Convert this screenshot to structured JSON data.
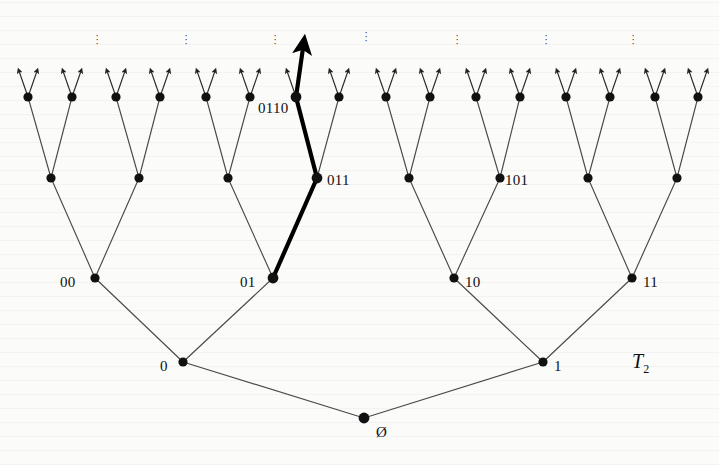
{
  "figure": {
    "tree_name": "T",
    "tree_subscript": "2",
    "background": "#fbfbfa",
    "node_color": "#111111",
    "edge_color": "#4a4a4a",
    "highlight_color": "#000000"
  },
  "labels": [
    {
      "name": "root-label",
      "text": "Ø",
      "x": 376,
      "y": 424
    },
    {
      "name": "node-0-label",
      "text": "0",
      "x": 160,
      "y": 358
    },
    {
      "name": "node-1-label",
      "text": "1",
      "x": 554,
      "y": 358
    },
    {
      "name": "node-00-label",
      "text": "00",
      "x": 60,
      "y": 274
    },
    {
      "name": "node-01-label",
      "text": "01",
      "x": 240,
      "y": 274
    },
    {
      "name": "node-10-label",
      "text": "10",
      "x": 465,
      "y": 274
    },
    {
      "name": "node-11-label",
      "text": "11",
      "x": 643,
      "y": 274
    },
    {
      "name": "node-011-label",
      "text": "011",
      "x": 327,
      "y": 172
    },
    {
      "name": "node-101-label",
      "text": "101",
      "x": 505,
      "y": 172
    },
    {
      "name": "node-0110-label",
      "text": "0110",
      "x": 258,
      "y": 100
    }
  ],
  "ellipses": [
    {
      "name": "ellipsis-1",
      "x": 93,
      "y": 33
    },
    {
      "name": "ellipsis-2",
      "x": 182,
      "y": 33
    },
    {
      "name": "ellipsis-3",
      "x": 271,
      "y": 33
    },
    {
      "name": "ellipsis-4",
      "x": 362,
      "y": 30
    },
    {
      "name": "ellipsis-5",
      "x": 453,
      "y": 33
    },
    {
      "name": "ellipsis-6",
      "x": 542,
      "y": 33
    },
    {
      "name": "ellipsis-7",
      "x": 629,
      "y": 33
    }
  ],
  "chart_data": {
    "type": "diagram",
    "levels": [
      {
        "depth": 0,
        "y": 418,
        "count": 1,
        "x": [
          364
        ]
      },
      {
        "depth": 1,
        "y": 362,
        "count": 2,
        "x": [
          183,
          543
        ]
      },
      {
        "depth": 2,
        "y": 278,
        "count": 4,
        "x": [
          95,
          273,
          454,
          632
        ]
      },
      {
        "depth": 3,
        "y": 178,
        "count": 8,
        "x": [
          51,
          139,
          228,
          317,
          409,
          500,
          588,
          677
        ]
      },
      {
        "depth": 4,
        "y": 97,
        "count": 16,
        "x": [
          28,
          72,
          116,
          160,
          206,
          250,
          296,
          339,
          386,
          430,
          476,
          520,
          566,
          610,
          655,
          698
        ]
      }
    ],
    "highlighted_path": [
      "Ø",
      "0",
      "01",
      "011",
      "0110"
    ],
    "highlighted_path_coords": [
      [
        364,
        418
      ],
      [
        183,
        363
      ],
      [
        273,
        278
      ],
      [
        317,
        178
      ],
      [
        296,
        97
      ],
      [
        303,
        48
      ]
    ],
    "labelled_nodes": [
      "Ø",
      "0",
      "1",
      "00",
      "01",
      "10",
      "11",
      "011",
      "101",
      "0110"
    ],
    "arrows_per_leaf": 2,
    "leaf_arrow_length": 26,
    "ellipsis_count": 7
  }
}
